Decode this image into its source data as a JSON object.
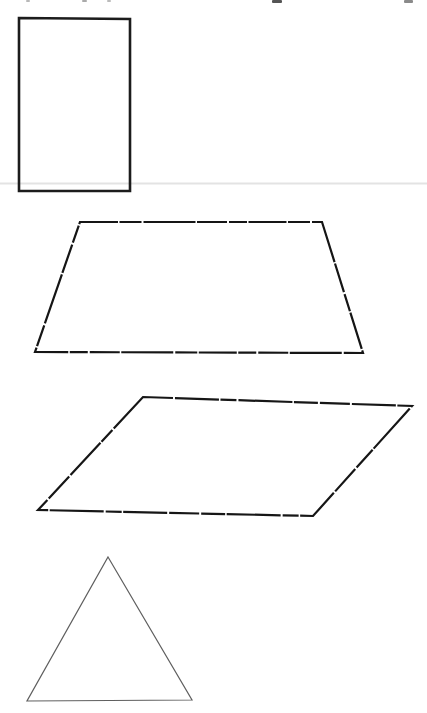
{
  "page": {
    "background_color": "#ffffff",
    "width": 427,
    "height": 713
  },
  "drawing": {
    "faint_line": {
      "name": "scan-rule-line",
      "y": 183.5,
      "x1": 0,
      "x2": 427,
      "color": "#e3e3e3",
      "width": 2
    },
    "top_edge_marks": [
      {
        "x": 26,
        "y": 0,
        "w": 4,
        "h": 2,
        "color": "#b8b8b8"
      },
      {
        "x": 82,
        "y": 0,
        "w": 5,
        "h": 2,
        "color": "#aaaaaa"
      },
      {
        "x": 107,
        "y": 0,
        "w": 4,
        "h": 2,
        "color": "#bbbbbb"
      },
      {
        "x": 272,
        "y": 0,
        "w": 10,
        "h": 3,
        "color": "#555555"
      },
      {
        "x": 404,
        "y": 0,
        "w": 9,
        "h": 3,
        "color": "#8a8a8a"
      }
    ],
    "shapes": [
      {
        "name": "rectangle",
        "stroke": "#1c1c1c",
        "stroke_width": 2.6,
        "dash": "",
        "points": [
          [
            19,
            18
          ],
          [
            130,
            19
          ],
          [
            130,
            191
          ],
          [
            19,
            191
          ]
        ]
      },
      {
        "name": "trapezoid",
        "stroke": "#151515",
        "stroke_width": 2.2,
        "dash": "38 1.5 22 2 52 1.5 30 2 18 1.5",
        "points": [
          [
            80,
            222
          ],
          [
            322,
            222
          ],
          [
            363,
            353
          ],
          [
            35,
            352
          ]
        ]
      },
      {
        "name": "parallelogram",
        "stroke": "#161616",
        "stroke_width": 2.2,
        "dash": "30 2 44 1.5 16 2 54 1.5 24 2",
        "points": [
          [
            143,
            397
          ],
          [
            412,
            406
          ],
          [
            313,
            516
          ],
          [
            38,
            510
          ]
        ]
      },
      {
        "name": "triangle",
        "stroke": "#5f5f5f",
        "stroke_width": 1.2,
        "dash": "",
        "points": [
          [
            108,
            557
          ],
          [
            192,
            700
          ],
          [
            27,
            701
          ]
        ]
      }
    ]
  }
}
